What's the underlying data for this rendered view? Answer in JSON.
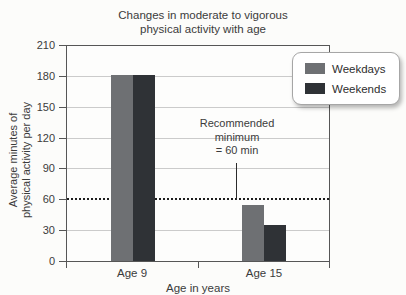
{
  "chart_data": {
    "type": "bar",
    "title": "Changes in moderate to vigorous\nphysical activity with age",
    "categories": [
      "Age 9",
      "Age 15"
    ],
    "series": [
      {
        "name": "Weekdays",
        "color": "#6e7073",
        "values": [
          182,
          55
        ]
      },
      {
        "name": "Weekends",
        "color": "#2f3236",
        "values": [
          182,
          35
        ]
      }
    ],
    "xlabel": "Age in years",
    "ylabel": "Average minutes of\nphysical activity per day",
    "ylim": [
      0,
      210
    ],
    "ytick_step": 30,
    "yticks": [
      0,
      30,
      60,
      90,
      120,
      150,
      180,
      210
    ],
    "grid": "horizontal",
    "legend_position": "top-right",
    "legend_entries": [
      "Weekdays",
      "Weekends"
    ],
    "annotation": {
      "text": "Recommended\nminimum\n= 60 min",
      "points_to_value": 60
    },
    "reference_line": {
      "value": 60,
      "style": "dotted",
      "color": "#1e1e1e"
    }
  },
  "colors": {
    "background": "#fcfcfa",
    "axis_frame": "#565656",
    "gridline": "#cbcbcb",
    "text": "#3b3b3b",
    "weekdays_bar": "#6e7073",
    "weekends_bar": "#2f3236"
  }
}
